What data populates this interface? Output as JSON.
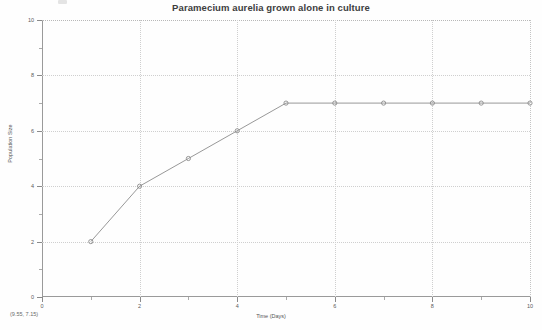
{
  "chart_data": {
    "type": "line",
    "title": "Paramecium aurelia grown alone in culture",
    "xlabel": "Time (Days)",
    "ylabel": "Population Size",
    "xlim": [
      0,
      10
    ],
    "ylim": [
      0,
      10
    ],
    "grid": true,
    "legend": "none",
    "x": [
      1,
      2,
      3,
      4,
      5,
      6,
      7,
      8,
      9,
      10
    ],
    "values": [
      2,
      4,
      5,
      6,
      7,
      7,
      7,
      7,
      7,
      7
    ],
    "series": [
      {
        "name": "Paramecium aurelia",
        "x": [
          1,
          2,
          3,
          4,
          5,
          6,
          7,
          8,
          9,
          10
        ],
        "values": [
          2,
          4,
          5,
          6,
          7,
          7,
          7,
          7,
          7,
          7
        ],
        "color": "#8c8c8c",
        "marker": "circle"
      }
    ],
    "xticks": [
      0,
      2,
      4,
      6,
      8,
      10
    ],
    "xticks_labels": [
      "0",
      "2",
      "4",
      "6",
      "8",
      "10"
    ],
    "yticks": [
      0,
      2,
      4,
      6,
      8,
      10
    ],
    "yticks_labels": [
      "0",
      "2",
      "4",
      "6",
      "8",
      "10"
    ],
    "xminor_ticks": [
      1,
      3,
      5,
      7,
      9
    ],
    "yminor_ticks": [
      1,
      3,
      5,
      7,
      9
    ]
  },
  "statusbar": {
    "coordinates": "(9.55, 7.15)"
  },
  "colors": {
    "series": "#8c8c8c",
    "axis": "#9a9a9a",
    "grid": "#cfcfcf",
    "text": "#555555",
    "background": "#fefefe"
  }
}
